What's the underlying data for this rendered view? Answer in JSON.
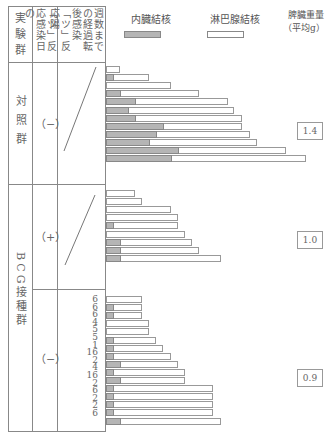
{
  "header": {
    "col1": "実験群",
    "col2": "「ツ」反応感染日の",
    "col3": "週数までの経過転後感染「ツ」反応陽"
  },
  "legend": {
    "inner_label": "内臓結核",
    "lymph_label": "淋巴腺結核",
    "weight_label_1": "脾臓重量",
    "weight_label_2": "（平均g）",
    "inner_color": "#b5b5b5",
    "lymph_color": "#ffffff"
  },
  "groups": {
    "control": {
      "label": "対照群",
      "reaction": "（−）",
      "weight": "1.4"
    },
    "bcg_pos": {
      "reaction": "（+）",
      "weight": "1.0"
    },
    "bcg_label": "BCG接種群",
    "bcg_neg": {
      "reaction": "（−）",
      "weight": "0.9"
    }
  },
  "week_numbers": [
    "6",
    "6",
    "6",
    "4",
    "5",
    "5",
    "1",
    "16",
    "2",
    "4",
    "16",
    "2",
    "6",
    "2",
    "2",
    "6"
  ],
  "chart_data": {
    "type": "bar",
    "orientation": "horizontal-stacked",
    "title": "",
    "legend": [
      "内臓結核",
      "淋巴腺結核"
    ],
    "unit": "relative lesion extent (px estimate)",
    "series_groups": [
      {
        "group": "対照群 (ツ反応 −)",
        "spleen_weight_avg_g": 1.4,
        "bars": [
          {
            "inner": 0,
            "total": 14
          },
          {
            "inner": 7,
            "total": 43
          },
          {
            "inner": 0,
            "total": 65
          },
          {
            "inner": 14,
            "total": 93
          },
          {
            "inner": 29,
            "total": 122
          },
          {
            "inner": 22,
            "total": 128
          },
          {
            "inner": 29,
            "total": 136
          },
          {
            "inner": 57,
            "total": 136
          },
          {
            "inner": 50,
            "total": 144
          },
          {
            "inner": 43,
            "total": 151
          },
          {
            "inner": 72,
            "total": 180
          },
          {
            "inner": 65,
            "total": 200
          }
        ]
      },
      {
        "group": "BCG接種群 (ツ反応 +)",
        "spleen_weight_avg_g": 1.0,
        "bars": [
          {
            "inner": 0,
            "total": 29
          },
          {
            "inner": 0,
            "total": 36
          },
          {
            "inner": 0,
            "total": 65
          },
          {
            "inner": 0,
            "total": 72
          },
          {
            "inner": 7,
            "total": 72
          },
          {
            "inner": 0,
            "total": 79
          },
          {
            "inner": 14,
            "total": 86
          },
          {
            "inner": 14,
            "total": 93
          },
          {
            "inner": 14,
            "total": 115
          }
        ]
      },
      {
        "group": "BCG接種群 (ツ反応 −)",
        "spleen_weight_avg_g": 0.9,
        "bars": [
          {
            "inner": 0,
            "total": 36,
            "week": "6"
          },
          {
            "inner": 7,
            "total": 36,
            "week": "6"
          },
          {
            "inner": 7,
            "total": 36,
            "week": "6"
          },
          {
            "inner": 0,
            "total": 43,
            "week": "4"
          },
          {
            "inner": 0,
            "total": 43,
            "week": "5"
          },
          {
            "inner": 7,
            "total": 50,
            "week": "5"
          },
          {
            "inner": 7,
            "total": 57,
            "week": "1"
          },
          {
            "inner": 7,
            "total": 65,
            "week": "16"
          },
          {
            "inner": 14,
            "total": 72,
            "week": "2"
          },
          {
            "inner": 7,
            "total": 79,
            "week": "4"
          },
          {
            "inner": 14,
            "total": 79,
            "week": "16"
          },
          {
            "inner": 7,
            "total": 107,
            "week": "2"
          },
          {
            "inner": 7,
            "total": 107,
            "week": "6"
          },
          {
            "inner": 7,
            "total": 107,
            "week": "2"
          },
          {
            "inner": 7,
            "total": 107,
            "week": "2"
          },
          {
            "inner": 14,
            "total": 115,
            "week": "6"
          }
        ]
      }
    ]
  }
}
